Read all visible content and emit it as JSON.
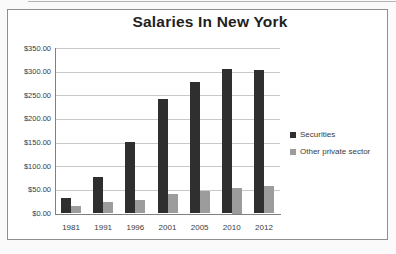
{
  "chart_data": {
    "type": "bar",
    "title": "Salaries In New York",
    "categories": [
      "1981",
      "1991",
      "1996",
      "2001",
      "2005",
      "2010",
      "2012"
    ],
    "series": [
      {
        "name": "Securities",
        "color": "#2f2f2f",
        "values": [
          32,
          77,
          152,
          242,
          279,
          305,
          303
        ]
      },
      {
        "name": "Other private sector",
        "color": "#9c9c9c",
        "values": [
          15,
          24,
          28,
          42,
          48,
          55,
          58
        ]
      }
    ],
    "ylabel": "",
    "xlabel": "",
    "ylim": [
      0,
      350
    ],
    "ytick_step": 50,
    "ytick_labels": [
      "$350.00",
      "$300.00",
      "$250.00",
      "$200.00",
      "$150.00",
      "$100.00",
      "$50.00",
      "$0.00"
    ],
    "grid": true,
    "legend_position": "right"
  },
  "colors": {
    "background": "#ffffff",
    "frame_border": "#8f8f8f",
    "gridline": "#c9c9c9",
    "axis": "#808080",
    "text": "#3a3a3a"
  }
}
